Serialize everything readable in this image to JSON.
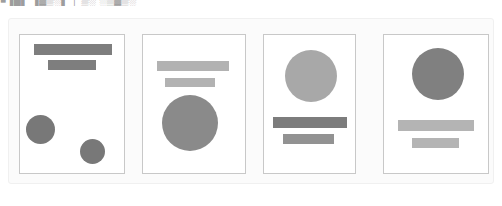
{
  "top_caption": {
    "text": "■▐█▌ ▐▓▒░▌ │ ▒░ ░▒▓▒░"
  },
  "panel": {
    "name": "layout-variant-gallery",
    "background": "#fbfbfb",
    "border_color": "#f0f0f0"
  },
  "palette": {
    "card_background": "#ffffff",
    "card_border": "#c8c8c8",
    "gray_dark": "#787878",
    "gray_medium": "#8e8e8e",
    "gray_light": "#a8a8a8",
    "gray_lighter": "#b4b4b4"
  },
  "cards": [
    {
      "id": "card-1",
      "label": "Variant 1",
      "shapes": [
        {
          "name": "headline-bar",
          "kind": "bar",
          "x": 14,
          "y": 9,
          "w": 78,
          "h": 11,
          "color": "#7e7e7e"
        },
        {
          "name": "subhead-bar",
          "kind": "bar",
          "x": 28,
          "y": 25,
          "w": 48,
          "h": 10,
          "color": "#7e7e7e"
        },
        {
          "name": "accent-circle-left",
          "kind": "circle",
          "x": 6,
          "y": 80,
          "w": 29,
          "h": 29,
          "color": "#787878"
        },
        {
          "name": "accent-circle-right",
          "kind": "circle",
          "x": 60,
          "y": 104,
          "w": 25,
          "h": 25,
          "color": "#787878"
        }
      ]
    },
    {
      "id": "card-2",
      "label": "Variant 2",
      "shapes": [
        {
          "name": "headline-bar",
          "kind": "bar",
          "x": 14,
          "y": 26,
          "w": 72,
          "h": 10,
          "color": "#b2b2b2"
        },
        {
          "name": "subhead-bar",
          "kind": "bar",
          "x": 22,
          "y": 43,
          "w": 50,
          "h": 9,
          "color": "#b2b2b2"
        },
        {
          "name": "hero-circle",
          "kind": "circle",
          "x": 19,
          "y": 60,
          "w": 56,
          "h": 56,
          "color": "#8a8a8a"
        }
      ]
    },
    {
      "id": "card-3",
      "label": "Variant 3",
      "shapes": [
        {
          "name": "hero-circle",
          "kind": "circle",
          "x": 21,
          "y": 15,
          "w": 52,
          "h": 52,
          "color": "#a8a8a8"
        },
        {
          "name": "headline-bar",
          "kind": "bar",
          "x": 9,
          "y": 82,
          "w": 74,
          "h": 11,
          "color": "#7c7c7c"
        },
        {
          "name": "subhead-bar",
          "kind": "bar",
          "x": 19,
          "y": 99,
          "w": 51,
          "h": 10,
          "color": "#929292"
        }
      ]
    },
    {
      "id": "card-4",
      "label": "Variant 4",
      "shapes": [
        {
          "name": "hero-circle",
          "kind": "circle",
          "x": 28,
          "y": 13,
          "w": 52,
          "h": 52,
          "color": "#808080"
        },
        {
          "name": "headline-bar",
          "kind": "bar",
          "x": 14,
          "y": 85,
          "w": 76,
          "h": 11,
          "color": "#b4b4b4"
        },
        {
          "name": "subhead-bar",
          "kind": "bar",
          "x": 28,
          "y": 103,
          "w": 47,
          "h": 10,
          "color": "#b4b4b4"
        }
      ]
    }
  ]
}
